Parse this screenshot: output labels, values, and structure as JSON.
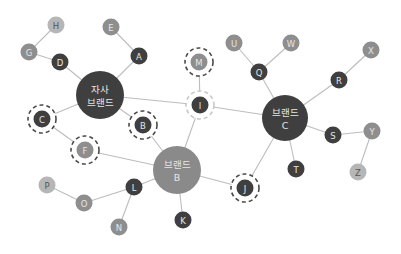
{
  "diagram": {
    "type": "network",
    "colors": {
      "dark": "#3f3f3f",
      "mid": "#8e8e8e",
      "light": "#b6b6b6",
      "brand_b": "#8a8a8a",
      "edge": "#bdbdbd",
      "ring_dark": "#4a4a4a",
      "ring_light": "#c8c8c8",
      "text_light": "#e6e6e6",
      "text_dark": "#555555"
    },
    "hubs": [
      {
        "id": "own",
        "line1": "자사",
        "line2": "브랜드",
        "x": 100,
        "y": 95,
        "r": 24,
        "fill": "dark"
      },
      {
        "id": "brandB",
        "line1": "브랜드",
        "line2": "B",
        "x": 177,
        "y": 170,
        "r": 24,
        "fill": "brand_b"
      },
      {
        "id": "brandC",
        "line1": "브랜드",
        "line2": "C",
        "x": 285,
        "y": 118,
        "r": 23,
        "fill": "dark"
      }
    ],
    "nodes": [
      {
        "id": "A",
        "label": "A",
        "x": 139,
        "y": 56,
        "fill": "dark",
        "ring": null
      },
      {
        "id": "B",
        "label": "B",
        "x": 143,
        "y": 125,
        "fill": "dark",
        "ring": "dark"
      },
      {
        "id": "C",
        "label": "C",
        "x": 42,
        "y": 119,
        "fill": "dark",
        "ring": "dark"
      },
      {
        "id": "D",
        "label": "D",
        "x": 60,
        "y": 62,
        "fill": "dark",
        "ring": null
      },
      {
        "id": "E",
        "label": "E",
        "x": 111,
        "y": 27,
        "fill": "mid",
        "ring": null
      },
      {
        "id": "F",
        "label": "F",
        "x": 85,
        "y": 150,
        "fill": "mid",
        "ring": "dark"
      },
      {
        "id": "G",
        "label": "G",
        "x": 29,
        "y": 52,
        "fill": "mid",
        "ring": null
      },
      {
        "id": "H",
        "label": "H",
        "x": 56,
        "y": 25,
        "fill": "light",
        "ring": null
      },
      {
        "id": "I",
        "label": "I",
        "x": 200,
        "y": 105,
        "fill": "dark",
        "ring": "light"
      },
      {
        "id": "J",
        "label": "J",
        "x": 245,
        "y": 188,
        "fill": "dark",
        "ring": "dark"
      },
      {
        "id": "K",
        "label": "K",
        "x": 183,
        "y": 220,
        "fill": "dark",
        "ring": null
      },
      {
        "id": "L",
        "label": "L",
        "x": 134,
        "y": 187,
        "fill": "dark",
        "ring": null
      },
      {
        "id": "M",
        "label": "M",
        "x": 199,
        "y": 62,
        "fill": "mid",
        "ring": "dark"
      },
      {
        "id": "N",
        "label": "N",
        "x": 119,
        "y": 227,
        "fill": "mid",
        "ring": null
      },
      {
        "id": "O",
        "label": "O",
        "x": 84,
        "y": 203,
        "fill": "mid",
        "ring": null
      },
      {
        "id": "P",
        "label": "P",
        "x": 47,
        "y": 185,
        "fill": "light",
        "ring": null
      },
      {
        "id": "Q",
        "label": "Q",
        "x": 259,
        "y": 72,
        "fill": "dark",
        "ring": null
      },
      {
        "id": "R",
        "label": "R",
        "x": 339,
        "y": 80,
        "fill": "dark",
        "ring": null
      },
      {
        "id": "S",
        "label": "S",
        "x": 333,
        "y": 135,
        "fill": "dark",
        "ring": null
      },
      {
        "id": "T",
        "label": "T",
        "x": 296,
        "y": 169,
        "fill": "dark",
        "ring": null
      },
      {
        "id": "U",
        "label": "U",
        "x": 234,
        "y": 43,
        "fill": "mid",
        "ring": null
      },
      {
        "id": "W",
        "label": "W",
        "x": 291,
        "y": 43,
        "fill": "mid",
        "ring": null
      },
      {
        "id": "X",
        "label": "X",
        "x": 371,
        "y": 50,
        "fill": "mid",
        "ring": null
      },
      {
        "id": "Y",
        "label": "Y",
        "x": 372,
        "y": 131,
        "fill": "mid",
        "ring": null
      },
      {
        "id": "Z",
        "label": "Z",
        "x": 358,
        "y": 172,
        "fill": "light",
        "ring": null
      }
    ],
    "edges": [
      [
        "H",
        "G"
      ],
      [
        "G",
        "D"
      ],
      [
        "D",
        "own"
      ],
      [
        "E",
        "A"
      ],
      [
        "A",
        "own"
      ],
      [
        "own",
        "C"
      ],
      [
        "own",
        "B"
      ],
      [
        "own",
        "I"
      ],
      [
        "C",
        "F"
      ],
      [
        "F",
        "brandB"
      ],
      [
        "B",
        "brandB"
      ],
      [
        "I",
        "M"
      ],
      [
        "I",
        "brandB"
      ],
      [
        "I",
        "brandC"
      ],
      [
        "brandB",
        "J"
      ],
      [
        "brandB",
        "K"
      ],
      [
        "brandB",
        "L"
      ],
      [
        "L",
        "O"
      ],
      [
        "L",
        "N"
      ],
      [
        "O",
        "P"
      ],
      [
        "J",
        "brandC"
      ],
      [
        "brandC",
        "Q"
      ],
      [
        "Q",
        "U"
      ],
      [
        "Q",
        "W"
      ],
      [
        "brandC",
        "R"
      ],
      [
        "R",
        "X"
      ],
      [
        "brandC",
        "S"
      ],
      [
        "S",
        "Y"
      ],
      [
        "Y",
        "Z"
      ],
      [
        "brandC",
        "T"
      ]
    ]
  }
}
